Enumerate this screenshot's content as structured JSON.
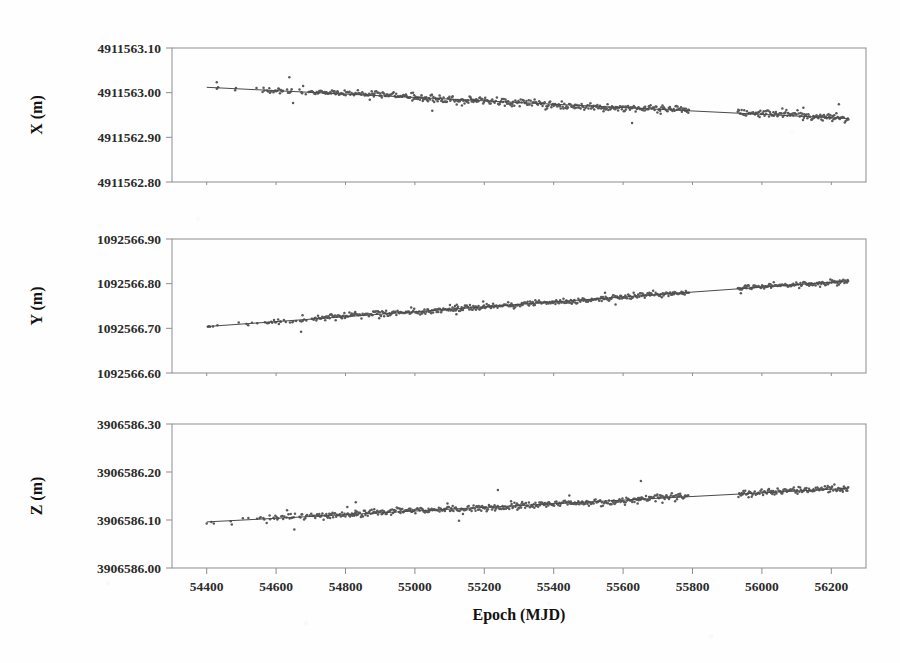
{
  "figure": {
    "background_color": "#fefefe",
    "point_color": "#5a5a5a",
    "line_color": "#4a4a4a",
    "frame_color": "#8d8d8d",
    "xlabel": "Epoch (MJD)"
  },
  "chart_data": [
    {
      "type": "scatter",
      "panel": "X",
      "title": "",
      "xlabel": "Epoch (MJD)",
      "ylabel": "X (m)",
      "xlim": [
        54300,
        56300
      ],
      "ylim": [
        4911562.8,
        4911563.1
      ],
      "yticks": [
        4911562.8,
        4911562.9,
        4911563.0,
        4911563.1
      ],
      "ytick_labels": [
        "4911562.80",
        "4911562.90",
        "4911563.00",
        "4911563.10"
      ],
      "xticks": [
        54400,
        54600,
        54800,
        55000,
        55200,
        55400,
        55600,
        55800,
        56000,
        56200
      ],
      "xtick_labels": [
        "54400",
        "54600",
        "54800",
        "55000",
        "55200",
        "55400",
        "55600",
        "55800",
        "56000",
        "56200"
      ],
      "grid": false,
      "legend": "none",
      "trend": {
        "x": [
          54400,
          56250
        ],
        "y": [
          4911563.012,
          4911562.942
        ],
        "slope_m_per_year": -0.0138
      },
      "scatter_scale": 0.012,
      "gaps": [
        [
          55790,
          55930
        ]
      ],
      "seed": 17
    },
    {
      "type": "scatter",
      "panel": "Y",
      "title": "",
      "xlabel": "Epoch (MJD)",
      "ylabel": "Y (m)",
      "xlim": [
        54300,
        56300
      ],
      "ylim": [
        1092566.6,
        1092566.9
      ],
      "yticks": [
        1092566.6,
        1092566.7,
        1092566.8,
        1092566.9
      ],
      "ytick_labels": [
        "1092566.60",
        "1092566.70",
        "1092566.80",
        "1092566.90"
      ],
      "xticks": [
        54400,
        54600,
        54800,
        55000,
        55200,
        55400,
        55600,
        55800,
        56000,
        56200
      ],
      "xtick_labels": [
        "54400",
        "54600",
        "54800",
        "55000",
        "55200",
        "55400",
        "55600",
        "55800",
        "56000",
        "56200"
      ],
      "grid": false,
      "legend": "none",
      "trend": {
        "x": [
          54400,
          56250
        ],
        "y": [
          1092566.704,
          1092566.806
        ],
        "slope_m_per_year": 0.0201
      },
      "scatter_scale": 0.009,
      "gaps": [
        [
          55790,
          55930
        ]
      ],
      "seed": 43
    },
    {
      "type": "scatter",
      "panel": "Z",
      "title": "",
      "xlabel": "Epoch (MJD)",
      "ylabel": "Z (m)",
      "xlim": [
        54300,
        56300
      ],
      "ylim": [
        3906586.0,
        3906586.3
      ],
      "yticks": [
        3906586.0,
        3906586.1,
        3906586.2,
        3906586.3
      ],
      "ytick_labels": [
        "3906586.00",
        "3906586.10",
        "3906586.20",
        "3906586.30"
      ],
      "xticks": [
        54400,
        54600,
        54800,
        55000,
        55200,
        55400,
        55600,
        55800,
        56000,
        56200
      ],
      "xtick_labels": [
        "54400",
        "54600",
        "54800",
        "55000",
        "55200",
        "55400",
        "55600",
        "55800",
        "56000",
        "56200"
      ],
      "grid": false,
      "legend": "none",
      "trend": {
        "x": [
          54400,
          56250
        ],
        "y": [
          3906586.096,
          3906586.166
        ],
        "slope_m_per_year": 0.0138
      },
      "scatter_scale": 0.011,
      "gaps": [
        [
          55790,
          55930
        ]
      ],
      "seed": 91
    }
  ]
}
